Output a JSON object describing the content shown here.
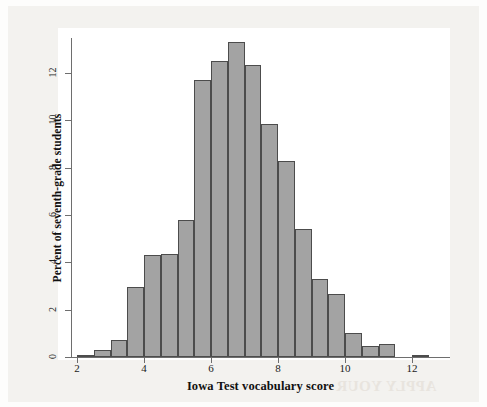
{
  "chart_data": {
    "type": "bar",
    "title": "",
    "xlabel": "Iowa Test vocabulary score",
    "ylabel": "Percent of seventh-grade students",
    "xlim": [
      1.6,
      13.0
    ],
    "ylim": [
      0,
      13.8
    ],
    "bin_width": 0.5,
    "grid": false,
    "legend": null,
    "xticks": [
      "2",
      "4",
      "6",
      "8",
      "10",
      "12"
    ],
    "xtick_values": [
      2,
      4,
      6,
      8,
      10,
      12
    ],
    "yticks": [
      "0",
      "2",
      "4",
      "6",
      "8",
      "10",
      "12"
    ],
    "ytick_values": [
      0,
      2,
      4,
      6,
      8,
      10,
      12
    ],
    "bin_starts": [
      2.0,
      2.5,
      3.0,
      3.5,
      4.0,
      4.5,
      5.0,
      5.5,
      6.0,
      6.5,
      7.0,
      7.5,
      8.0,
      8.5,
      9.0,
      9.5,
      10.0,
      10.5,
      11.0,
      11.5,
      12.0
    ],
    "categories": [
      "2.0-2.5",
      "2.5-3.0",
      "3.0-3.5",
      "3.5-4.0",
      "4.0-4.5",
      "4.5-5.0",
      "5.0-5.5",
      "5.5-6.0",
      "6.0-6.5",
      "6.5-7.0",
      "7.0-7.5",
      "7.5-8.0",
      "8.0-8.5",
      "8.5-9.0",
      "9.0-9.5",
      "9.5-10.0",
      "10.0-10.5",
      "10.5-11.0",
      "11.0-11.5",
      "11.5-12.0",
      "12.0-12.5"
    ],
    "values": [
      0.1,
      0.3,
      0.7,
      2.95,
      4.3,
      4.35,
      5.8,
      11.7,
      12.5,
      13.3,
      12.35,
      9.85,
      8.3,
      5.4,
      3.3,
      2.65,
      1.0,
      0.45,
      0.55,
      0.0,
      0.1
    ],
    "bar_fill_color": "#a3a3a3",
    "bar_edge_color": "#4c4c4c",
    "axis_color": "#6e6e6e",
    "plot_background": "#ffffff",
    "page_background": "#f3f2ef"
  },
  "artifacts": {
    "bleed_through_text": "APPLY YOUR"
  }
}
